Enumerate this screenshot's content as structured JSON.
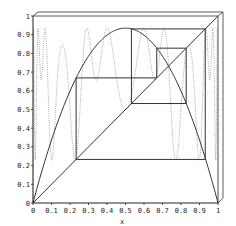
{
  "chart_data": {
    "type": "line",
    "title": "",
    "xlabel": "x",
    "ylabel": "",
    "xlim": [
      0,
      1
    ],
    "ylim": [
      0,
      1
    ],
    "grid": false,
    "legend": null,
    "x_ticks": [
      "0",
      "0.1",
      "0.2",
      "0.3",
      "0.4",
      "0.5",
      "0.6",
      "0.7",
      "0.8",
      "0.9",
      "1"
    ],
    "y_ticks": [
      "0",
      "0.1",
      "0.2",
      "0.3",
      "0.4",
      "0.5",
      "0.6",
      "0.7",
      "0.8",
      "0.9",
      "1"
    ],
    "series": [
      {
        "name": "logistic map f(x) = r x (1 - x)",
        "style": "solid",
        "r": 3.74,
        "peak": [
          0.5,
          0.935
        ]
      },
      {
        "name": "diagonal y = x",
        "style": "solid",
        "points": [
          [
            0,
            0
          ],
          [
            1,
            1
          ]
        ]
      },
      {
        "name": "fifth iterate f^5(x)",
        "style": "dotted",
        "r": 3.74,
        "iterate": 5
      },
      {
        "name": "cobweb period-5 orbit",
        "style": "solid",
        "orbit": [
          0.233,
          0.669,
          0.828,
          0.532,
          0.931
        ],
        "points": [
          [
            0.233,
            0.233
          ],
          [
            0.233,
            0.669
          ],
          [
            0.669,
            0.669
          ],
          [
            0.669,
            0.828
          ],
          [
            0.828,
            0.828
          ],
          [
            0.828,
            0.532
          ],
          [
            0.532,
            0.532
          ],
          [
            0.532,
            0.931
          ],
          [
            0.931,
            0.931
          ],
          [
            0.931,
            0.233
          ],
          [
            0.233,
            0.233
          ]
        ]
      }
    ],
    "frame": "3D-style box: top-left offset border drawn above and right of axes"
  },
  "colors": {
    "line": "#333333",
    "dotted": "#777777",
    "axis": "#222222"
  }
}
